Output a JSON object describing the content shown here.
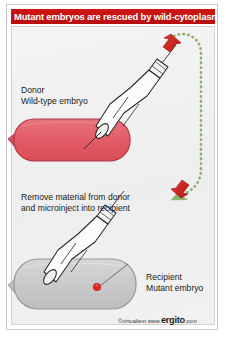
{
  "figure": {
    "title": "Mutant embryos are rescued by wild-cytoplasm",
    "title_bg_color": "#cc1111",
    "title_text_color": "#ffffff",
    "panel_bg_color": "#f1f1f1"
  },
  "labels": {
    "donor_role": "Donor",
    "donor_desc": "Wild-type embryo",
    "middle_step": "Remove material from donor",
    "middle_step_2": "and microinject into recipient",
    "recipient_role": "Recipient",
    "recipient_desc": "Mutant embryo"
  },
  "colors": {
    "role_label": "#d2322d",
    "donor_embryo_fill": "#e4636d",
    "donor_embryo_stroke": "#b03a45",
    "recipient_embryo_fill": "#cccccc",
    "recipient_embryo_stroke": "#9a9a9a",
    "transfer_arrow": "#8db36a",
    "action_arrow": "#cc2222",
    "injected_dot": "#dd2222",
    "pipette_stroke": "#2b2b2b"
  },
  "icons": {
    "donor_pipette": "micropipette-icon",
    "recipient_pipette": "micropipette-icon",
    "extract_arrow": "red-up-arrow-icon",
    "inject_arrow": "red-down-arrow-icon",
    "transfer_path": "green-dotted-arrow-icon",
    "cytoplasm_dot": "red-dot-icon"
  },
  "credit": {
    "copyright": "©virtualtext",
    "www": "www.",
    "brand": "ergito",
    "tld": ".com"
  }
}
